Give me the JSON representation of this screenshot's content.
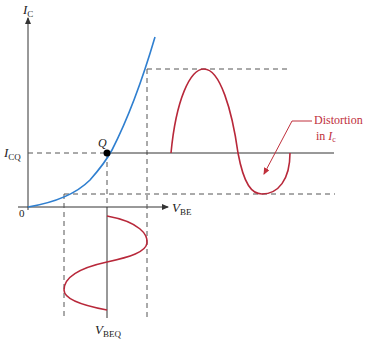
{
  "diagram": {
    "labels": {
      "y_axis": {
        "main": "I",
        "sub": "C"
      },
      "x_axis": {
        "main": "V",
        "sub": "BE"
      },
      "origin": "0",
      "icq": {
        "main": "I",
        "sub": "CQ"
      },
      "q_point": "Q",
      "vbeq": {
        "main": "V",
        "sub": "BEQ"
      },
      "annotation_line1": "Distortion",
      "annotation_line2_prefix": "in ",
      "annotation_line2_main": "I",
      "annotation_line2_sub": "c"
    },
    "colors": {
      "curve": "#2f7fd0",
      "signal": "#b8283a",
      "axis": "#333333",
      "dashed": "#555555",
      "annotation": "#c0303c"
    }
  }
}
